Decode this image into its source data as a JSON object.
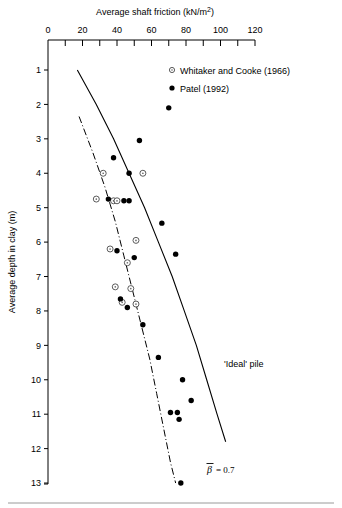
{
  "figure": {
    "xaxis": {
      "title": "Average shaft friction (kN/m",
      "title_sup": "2",
      "title_close": ")",
      "title_full": "Average shaft friction (kN/m2)",
      "ticks_major": [
        0,
        20,
        40,
        60,
        80,
        100,
        120
      ],
      "tick_labels": [
        "0",
        "20",
        "40",
        "60",
        "80",
        "100",
        "120"
      ],
      "minor_step": 10,
      "range": [
        0,
        120
      ],
      "position": "top"
    },
    "yaxis": {
      "title": "Average depth in clay (m)",
      "ticks_major": [
        1,
        2,
        3,
        4,
        5,
        6,
        7,
        8,
        9,
        10,
        11,
        12,
        13
      ],
      "tick_labels": [
        "1",
        "2",
        "3",
        "4",
        "5",
        "6",
        "7",
        "8",
        "9",
        "10",
        "11",
        "12",
        "13"
      ],
      "range": [
        0.6,
        13.0
      ],
      "direction": "inverted"
    },
    "legend": {
      "position": "top-right",
      "entries": [
        {
          "marker": "open-circle",
          "label": "Whitaker and Cooke (1966)"
        },
        {
          "marker": "filled-circle",
          "label": "Patel (1992)"
        }
      ]
    },
    "annotations": [
      {
        "name": "ideal-pile-label",
        "text": "'Ideal' pile",
        "x": 222,
        "y": 364
      },
      {
        "name": "beta-label-symbol",
        "text": "β",
        "overbar": true,
        "x": 208,
        "y": 470
      },
      {
        "name": "beta-label-value",
        "text": "= 0.7",
        "x": 218,
        "y": 470
      }
    ]
  },
  "chart_data": {
    "type": "scatter",
    "title": "",
    "xlabel": "Average shaft friction (kN/m2)",
    "ylabel": "Average depth in clay (m)",
    "xlim": [
      0,
      120
    ],
    "ylim": [
      13.0,
      0.6
    ],
    "y_inverted": true,
    "grid": false,
    "legend_position": "top-right",
    "series": [
      {
        "name": "Whitaker and Cooke (1966)",
        "marker": "open-circle",
        "points": [
          {
            "x": 32,
            "y": 4.0
          },
          {
            "x": 55,
            "y": 4.0
          },
          {
            "x": 28,
            "y": 4.75
          },
          {
            "x": 38,
            "y": 4.8
          },
          {
            "x": 40,
            "y": 4.8
          },
          {
            "x": 51,
            "y": 5.95
          },
          {
            "x": 36,
            "y": 6.2
          },
          {
            "x": 46,
            "y": 6.6
          },
          {
            "x": 39,
            "y": 7.3
          },
          {
            "x": 48,
            "y": 7.35
          },
          {
            "x": 43,
            "y": 7.75
          },
          {
            "x": 51,
            "y": 7.8
          }
        ]
      },
      {
        "name": "Patel (1992)",
        "marker": "filled-circle",
        "points": [
          {
            "x": 70,
            "y": 2.1
          },
          {
            "x": 53,
            "y": 3.05
          },
          {
            "x": 38,
            "y": 3.55
          },
          {
            "x": 47,
            "y": 4.0
          },
          {
            "x": 35,
            "y": 4.75
          },
          {
            "x": 44,
            "y": 4.8
          },
          {
            "x": 47,
            "y": 4.8
          },
          {
            "x": 66,
            "y": 5.45
          },
          {
            "x": 40,
            "y": 6.25
          },
          {
            "x": 50,
            "y": 6.45
          },
          {
            "x": 74,
            "y": 6.35
          },
          {
            "x": 42,
            "y": 7.65
          },
          {
            "x": 46,
            "y": 7.9
          },
          {
            "x": 55,
            "y": 8.4
          },
          {
            "x": 64,
            "y": 9.35
          },
          {
            "x": 78,
            "y": 10.0
          },
          {
            "x": 71,
            "y": 10.95
          },
          {
            "x": 75,
            "y": 10.95
          },
          {
            "x": 83,
            "y": 10.6
          },
          {
            "x": 76,
            "y": 11.15
          },
          {
            "x": 77,
            "y": 13.0
          }
        ]
      }
    ],
    "curves": [
      {
        "name": "'Ideal' pile",
        "style": "solid",
        "label": "'Ideal' pile",
        "points": [
          {
            "x": 17,
            "y": 1.0
          },
          {
            "x": 28,
            "y": 2.0
          },
          {
            "x": 38,
            "y": 3.0
          },
          {
            "x": 47,
            "y": 4.0
          },
          {
            "x": 56,
            "y": 5.0
          },
          {
            "x": 64,
            "y": 6.0
          },
          {
            "x": 72,
            "y": 7.0
          },
          {
            "x": 79,
            "y": 8.0
          },
          {
            "x": 86,
            "y": 9.0
          },
          {
            "x": 92,
            "y": 10.0
          },
          {
            "x": 98,
            "y": 11.0
          },
          {
            "x": 103,
            "y": 11.8
          }
        ]
      },
      {
        "name": "beta-0.7-line",
        "style": "dash-dot",
        "label": "beta = 0.7",
        "points": [
          {
            "x": 18,
            "y": 2.35
          },
          {
            "x": 26,
            "y": 3.4
          },
          {
            "x": 33,
            "y": 4.4
          },
          {
            "x": 39,
            "y": 5.4
          },
          {
            "x": 44,
            "y": 6.4
          },
          {
            "x": 49,
            "y": 7.4
          },
          {
            "x": 54,
            "y": 8.4
          },
          {
            "x": 59,
            "y": 9.4
          },
          {
            "x": 63,
            "y": 10.4
          },
          {
            "x": 67,
            "y": 11.4
          },
          {
            "x": 71,
            "y": 12.4
          },
          {
            "x": 74,
            "y": 13.0
          }
        ]
      }
    ]
  }
}
